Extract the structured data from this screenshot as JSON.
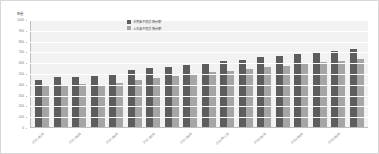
{
  "chart_data": {
    "type": "bar",
    "title": "",
    "subtitle": "",
    "xlabel": "",
    "ylabel": "数量",
    "ylim": [
      0,
      1000
    ],
    "grid": true,
    "legend_position": "top-center",
    "y_ticks": [
      "0",
      "100",
      "200",
      "300",
      "400",
      "500",
      "600",
      "700",
      "800",
      "900",
      "1000"
    ],
    "categories": [
      "2021年1月",
      "2021年2月",
      "2021年3月",
      "2021年4月",
      "2021年5月",
      "2021年6月",
      "2021年7月",
      "2021年8月",
      "2021年9月",
      "2021年10月",
      "2021年11月",
      "2021年12月",
      "2022年1月",
      "2022年2月",
      "2022年3月",
      "2022年4月",
      "2022年5月",
      "2022年6月"
    ],
    "visible_tick_labels": [
      "2021年1月",
      "2021年3月",
      "2021年5月",
      "2021年7月",
      "2021年9月",
      "2021年11月",
      "2022年1月",
      "2022年3月",
      "2022年5月",
      "2022年6月"
    ],
    "series": [
      {
        "name": "本期末不良贷款余额",
        "color": "#5d5d5d",
        "values": [
          435,
          460,
          462,
          472,
          492,
          530,
          545,
          560,
          570,
          595,
          610,
          625,
          645,
          660,
          678,
          690,
          705,
          722
        ]
      },
      {
        "name": "上年末不良贷款余额",
        "color": "#a5a5a5",
        "values": [
          378,
          392,
          395,
          392,
          403,
          435,
          455,
          470,
          488,
          508,
          520,
          535,
          552,
          568,
          580,
          600,
          612,
          628
        ]
      }
    ]
  },
  "legend": {
    "items": [
      {
        "label": "本期末不良贷款余额",
        "color": "#5d5d5d"
      },
      {
        "label": "上年末不良贷款余额",
        "color": "#a5a5a5"
      }
    ]
  },
  "axis": {
    "y_title": "数量"
  }
}
